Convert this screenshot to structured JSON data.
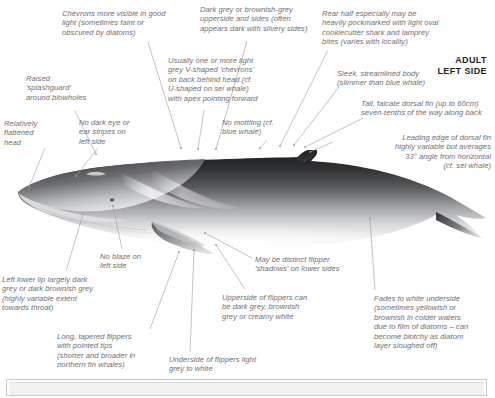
{
  "plate": {
    "title_lines": "ADULT\nLEFT SIDE",
    "subject": "fin-whale",
    "colors": {
      "text": "#6d6e71",
      "heading": "#231f20",
      "leader": "#9a9b9d",
      "body_dark": "#2b2b2d",
      "body_mid": "#6f7174",
      "body_light": "#f4f4f4",
      "panel_border": "#c9cacc",
      "panel_fill": "#f1f1f2"
    }
  },
  "annotations": [
    {
      "id": "chevrons-visibility",
      "text": "Chevrons more visible in good\nlight (sometimes faint or\nobscured by diatoms)",
      "align": "left",
      "x": 62,
      "y": 9,
      "w": 142
    },
    {
      "id": "dark-grey-upperside",
      "text": "Dark grey or brownish-grey\nupperside and sides (often\nappears dark with silvery sides)",
      "align": "left",
      "x": 200,
      "y": 5,
      "w": 150
    },
    {
      "id": "cookiecutter-bites",
      "text": "Rear half especially may be\nheavily pockmarked with light oval\ncookiecutter shark and lamprey\nbites (varies with locality)",
      "align": "left",
      "x": 322,
      "y": 9,
      "w": 170
    },
    {
      "id": "raised-splashguard",
      "text": "Raised\n'splashguard'\naround blowholes",
      "align": "left",
      "x": 26,
      "y": 74,
      "w": 82
    },
    {
      "id": "v-shaped-chevrons",
      "text": "Usually one or more light\ngrey V-shaped 'chevrons'\non back behind head (cf.\nU-shaped on sei whale)\nwith apex pointing forward",
      "align": "left",
      "x": 168,
      "y": 56,
      "w": 128
    },
    {
      "id": "sleek-streamlined-body",
      "text": "Sleek, streamlined body\n(slimmer than blue whale)",
      "align": "left",
      "x": 337,
      "y": 69,
      "w": 125
    },
    {
      "id": "relatively-flattened-head",
      "text": "Relatively\nflattened\nhead",
      "align": "left",
      "x": 4,
      "y": 119,
      "w": 58
    },
    {
      "id": "no-dark-eye-stripes",
      "text": "No dark eye or\near stripes on\nleft side",
      "align": "left",
      "x": 79,
      "y": 118,
      "w": 75
    },
    {
      "id": "no-mottling",
      "text": "No mottling (cf.\nblue whale)",
      "align": "left",
      "x": 222,
      "y": 118,
      "w": 82
    },
    {
      "id": "tall-falcate-dorsal-fin",
      "text": "Tall, falcate dorsal fin (up to 60cm)\nseven-tenths of the way along back",
      "align": "left",
      "x": 361,
      "y": 99,
      "w": 175
    },
    {
      "id": "leading-edge-dorsal-fin",
      "text": "Leading edge of dorsal fin\nhighly variable but averages\n33° angle from horizontal\n(cf. sei whale)",
      "align": "right",
      "x": 338,
      "y": 133,
      "w": 153
    },
    {
      "id": "no-blaze-left-side",
      "text": "No blaze on\nleft side",
      "align": "left",
      "x": 100,
      "y": 252,
      "w": 70
    },
    {
      "id": "left-lower-lip-dark",
      "text": "Left lower lip largely dark\ngrey or dark brownish grey\n(highly variable extent\ntowards throat)",
      "align": "left",
      "x": 2,
      "y": 275,
      "w": 140
    },
    {
      "id": "may-be-flipper-shadows",
      "text": "May be distinct flipper\n'shadows' on lower sides",
      "align": "left",
      "x": 255,
      "y": 255,
      "w": 125
    },
    {
      "id": "upperside-of-flippers",
      "text": "Upperside of flippers can\nbe dark grey, brownish\ngrey or creamy white",
      "align": "left",
      "x": 222,
      "y": 293,
      "w": 130
    },
    {
      "id": "fades-to-white-underside",
      "text": "Fades to white underside\n(sometimes yellowish or\nbrownish in colder waters\ndue to film of diatoms – can\nbecome blotchy as diatom\nlayer sloughed off)",
      "align": "left",
      "x": 374,
      "y": 294,
      "w": 140
    },
    {
      "id": "long-tapered-flippers",
      "text": "Long, tapered flippers\nwith pointed tips\n(shorter and broader in\nnorthern fin whales)",
      "align": "left",
      "x": 57,
      "y": 332,
      "w": 120
    },
    {
      "id": "underside-of-flippers",
      "text": "Underside of flippers light\ngrey to white",
      "align": "left",
      "x": 169,
      "y": 355,
      "w": 130
    }
  ],
  "leader_lines": [
    {
      "id": "leader-chevrons-visibility",
      "points": "148,42 181,148"
    },
    {
      "id": "leader-dark-grey-upperside",
      "points": "247,41 216,149"
    },
    {
      "id": "leader-cookiecutter-bites",
      "points": "328,50 280,146"
    },
    {
      "id": "leader-raised-splashguard",
      "points": "75,111 96,154"
    },
    {
      "id": "leader-v-shaped-chevrons",
      "points": "204,110 198,149"
    },
    {
      "id": "leader-sleek-body",
      "points": "339,87 294,145"
    },
    {
      "id": "leader-flattened-head",
      "points": "45,148 29,187"
    },
    {
      "id": "leader-no-dark-eye",
      "points": "98,148 76,176"
    },
    {
      "id": "leader-no-mottling",
      "points": "267,140 260,148"
    },
    {
      "id": "leader-tall-dorsal-fin",
      "points": "363,118 305,147"
    },
    {
      "id": "leader-leading-edge-fin",
      "points": "333,142 310,152"
    },
    {
      "id": "leader-no-blaze",
      "points": "122,249 113,206"
    },
    {
      "id": "leader-left-lower-lip",
      "points": "66,271 83,214"
    },
    {
      "id": "leader-flipper-shadows",
      "points": "252,258 205,233"
    },
    {
      "id": "leader-upperside-flippers",
      "points": "245,289 216,245"
    },
    {
      "id": "leader-fades-white",
      "points": "375,290 370,219"
    },
    {
      "id": "leader-long-tapered-flippers",
      "points": "150,329 179,252"
    },
    {
      "id": "leader-underside-flippers",
      "points": "190,352 194,250"
    }
  ],
  "panel": {
    "id": "bottom-panel",
    "visible": true
  }
}
